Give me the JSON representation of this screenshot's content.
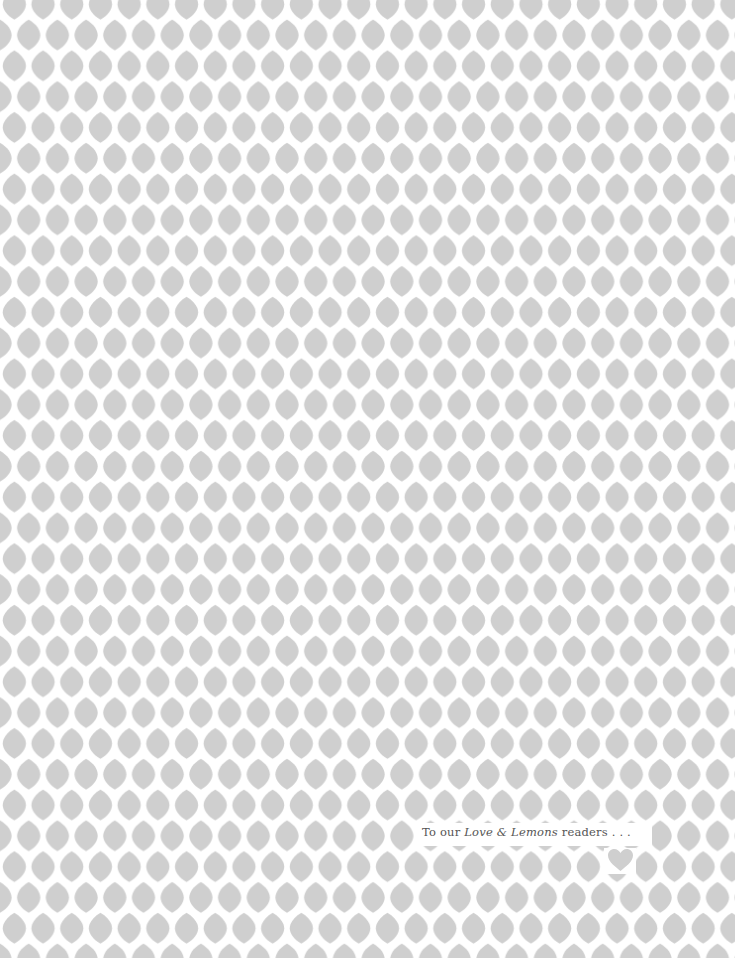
{
  "page": {
    "background_color": "#ffffff",
    "pattern": {
      "motif": "lemon",
      "color": "#cfcfcf",
      "tile_width": 28.7,
      "tile_height": 61.6
    },
    "dedication": {
      "prefix": "To our ",
      "title_italic": "Love & Lemons",
      "suffix": " readers . . .",
      "color": "#555555"
    },
    "accent_heart": {
      "icon": "heart-icon",
      "color": "#cfcfcf"
    }
  }
}
